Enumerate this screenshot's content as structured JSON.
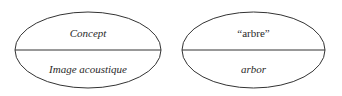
{
  "diagram": {
    "signs": [
      {
        "top": "Concept",
        "bottom": "Image acoustique",
        "top_italic": true,
        "bottom_italic": true
      },
      {
        "top": "“arbre”",
        "bottom": "arbor",
        "top_italic": false,
        "bottom_italic": true
      }
    ],
    "stroke_color": "#333333"
  }
}
